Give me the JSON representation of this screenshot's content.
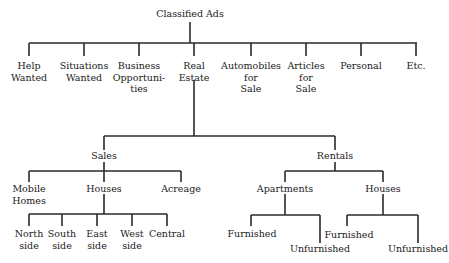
{
  "diagram": {
    "type": "tree",
    "root": "Classified Ads",
    "level1": [
      {
        "label": "Help\nWanted"
      },
      {
        "label": "Situations\nWanted"
      },
      {
        "label": "Business\nOpportuni-\nties"
      },
      {
        "label": "Real\nEstate"
      },
      {
        "label": "Automobiles\nfor\nSale"
      },
      {
        "label": "Articles\nfor\nSale"
      },
      {
        "label": "Personal"
      },
      {
        "label": "Etc."
      }
    ],
    "real_estate": {
      "sales": {
        "label": "Sales",
        "children": [
          {
            "label": "Mobile\nHomes"
          },
          {
            "label": "Houses"
          },
          {
            "label": "Acreage"
          }
        ],
        "houses_children": [
          {
            "label": "North\nside"
          },
          {
            "label": "South\nside"
          },
          {
            "label": "East\nside"
          },
          {
            "label": "West\nside"
          },
          {
            "label": "Central"
          }
        ]
      },
      "rentals": {
        "label": "Rentals",
        "children": [
          {
            "label": "Apartments"
          },
          {
            "label": "Houses"
          }
        ],
        "apartments_children": [
          {
            "label": "Furnished"
          },
          {
            "label": "Unfurnished"
          }
        ],
        "houses_children": [
          {
            "label": "Furnished"
          },
          {
            "label": "Unfurnished"
          }
        ]
      }
    }
  }
}
